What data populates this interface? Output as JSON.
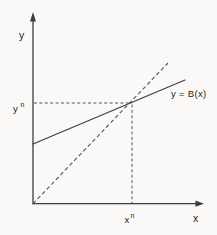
{
  "figure": {
    "background_color": "#faf9f7",
    "line_color": "#3d3d3d",
    "guide_color": "#555555",
    "text_color": "#222222",
    "labels": {
      "y_axis": "y",
      "x_axis": "x",
      "function": "y = B(x)",
      "fixed_point_y_base": "y",
      "fixed_point_y_sup": "n",
      "fixed_point_x_base": "x",
      "fixed_point_x_sup": "n"
    },
    "geometry": {
      "y_axis": [
        [
          33,
          203.7
        ],
        [
          33,
          20
        ]
      ],
      "x_axis": [
        [
          33,
          203.7
        ],
        [
          196.5,
          203.7
        ]
      ],
      "diagonal_45_line": [
        [
          33,
          203.7
        ],
        [
          168,
          63
        ]
      ],
      "function_line": [
        [
          33,
          144
        ],
        [
          185,
          80
        ]
      ],
      "horizontal_guide": [
        [
          34,
          103
        ],
        [
          132,
          103
        ]
      ],
      "vertical_guide": [
        [
          132,
          104.5
        ],
        [
          132,
          203
        ]
      ]
    }
  }
}
